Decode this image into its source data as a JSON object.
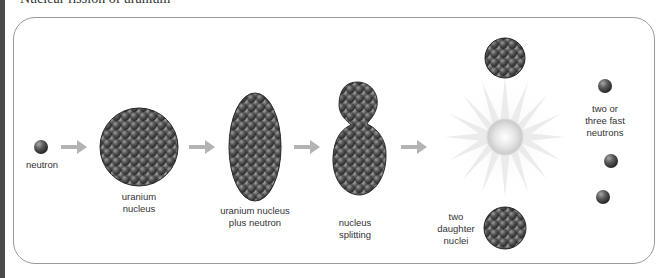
{
  "diagram": {
    "title_cut_off": "Nuclear fission of uranium",
    "labels": {
      "neutron": "neutron",
      "uranium_nucleus_line1": "uranium",
      "uranium_nucleus_line2": "nucleus",
      "plus_neutron_line1": "uranium nucleus",
      "plus_neutron_line2": "plus neutron",
      "splitting_line1": "nucleus",
      "splitting_line2": "splitting",
      "daughter_line1": "two",
      "daughter_line2": "daughter",
      "daughter_line3": "nuclei",
      "fast_line1": "two or",
      "fast_line2": "three fast",
      "fast_line3": "neutrons"
    },
    "colors": {
      "nucleon": "#5a5a5a",
      "arrow": "#b3b3b3",
      "frame": "#9a9a9a",
      "left_bar": "#4a4a4a"
    },
    "stages": [
      "neutron",
      "uranium nucleus",
      "uranium nucleus plus neutron",
      "nucleus splitting",
      "two daughter nuclei",
      "two or three fast neutrons"
    ]
  }
}
